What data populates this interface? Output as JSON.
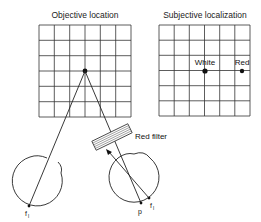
{
  "diagram": {
    "left_panel": {
      "title": "Objective location",
      "grid": {
        "rows": 6,
        "cols": 6
      }
    },
    "right_panel": {
      "title": "Subjective localization",
      "grid": {
        "rows": 6,
        "cols": 6
      },
      "points": [
        {
          "label": "White"
        },
        {
          "label": "Red"
        }
      ]
    },
    "filter": {
      "label": "Red filter",
      "color_name": "red"
    },
    "left_eye": {
      "point_label": "f",
      "point_sub": "l"
    },
    "right_eye": {
      "point_p_label": "p",
      "point_f_label": "f",
      "point_f_sub": "l"
    },
    "colors": {
      "ink": "#222222",
      "background": "#ffffff"
    }
  }
}
